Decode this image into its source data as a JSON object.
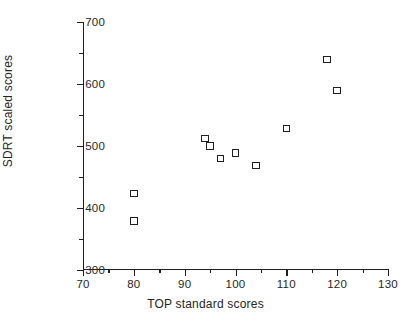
{
  "chart_data": {
    "type": "scatter",
    "title": "",
    "xlabel": "TOP standard scores",
    "ylabel": "SDRT scaled scores",
    "xlim": [
      70,
      130
    ],
    "ylim": [
      300,
      700
    ],
    "x_major_ticks": [
      70,
      80,
      90,
      100,
      110,
      120,
      130
    ],
    "x_minor_ticks": [
      75,
      85,
      95,
      105,
      115,
      125
    ],
    "y_major_ticks": [
      300,
      400,
      500,
      600,
      700
    ],
    "y_minor_ticks": [
      350,
      450,
      550,
      650
    ],
    "x_tick_labels": [
      "70",
      "80",
      "90",
      "100",
      "110",
      "120",
      "130"
    ],
    "y_tick_labels": [
      "300",
      "400",
      "500",
      "600",
      "700"
    ],
    "grid": false,
    "legend": null,
    "marker_style": "open-square",
    "points": [
      {
        "x": 80,
        "y": 423
      },
      {
        "x": 80,
        "y": 379
      },
      {
        "x": 94,
        "y": 512
      },
      {
        "x": 95,
        "y": 500
      },
      {
        "x": 97,
        "y": 480
      },
      {
        "x": 100,
        "y": 489
      },
      {
        "x": 104,
        "y": 469
      },
      {
        "x": 110,
        "y": 528
      },
      {
        "x": 118,
        "y": 640
      },
      {
        "x": 120,
        "y": 590
      }
    ]
  },
  "colors": {
    "background": "#ffffff",
    "axis": "#1f1f1f",
    "text": "#262626",
    "marker_edge": "#1f1f1f",
    "marker_fill": "#ffffff"
  }
}
